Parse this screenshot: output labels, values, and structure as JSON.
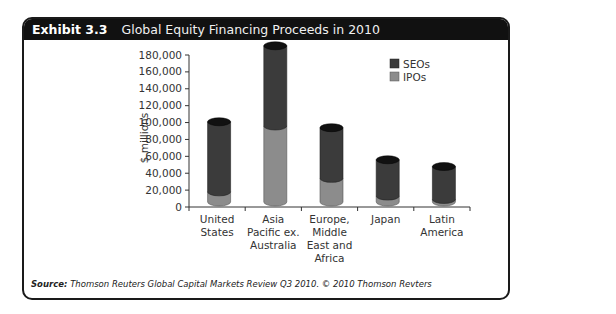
{
  "exhibit": {
    "number": "Exhibit 3.3",
    "title": "Global Equity Financing Proceeds in 2010"
  },
  "source": {
    "label": "Source:",
    "text": "Thomson Reuters Global Capital Markets Review Q3 2010. © 2010 Thomson Revters"
  },
  "colors": {
    "seo": "#3b3b3b",
    "seo_top": "#111111",
    "ipo": "#8c8c8c",
    "ipo_light": "#a5a5a5",
    "header_bg": "#111111"
  },
  "chart_data": {
    "type": "bar",
    "stacked": true,
    "style": "3d-cylinder",
    "title": "Global Equity Financing Proceeds in 2010",
    "xlabel": "",
    "ylabel": "$ millions",
    "ylim": [
      0,
      180000
    ],
    "yticks": [
      0,
      20000,
      40000,
      60000,
      80000,
      100000,
      120000,
      140000,
      160000,
      180000
    ],
    "ytick_labels": [
      "0",
      "20,000",
      "40,000",
      "60,000",
      "80,000",
      "100,000",
      "120,000",
      "140,000",
      "160,000",
      "180,000"
    ],
    "grid": false,
    "legend_position": "upper right",
    "categories": [
      [
        "United",
        "States"
      ],
      [
        "Asia",
        "Pacific ex.",
        "Australia"
      ],
      [
        "Europe,",
        "Middle",
        "East and",
        "Africa"
      ],
      [
        "Japan"
      ],
      [
        "Latin",
        "America"
      ]
    ],
    "category_names": [
      "United States",
      "Asia Pacific ex. Australia",
      "Europe, Middle East and Africa",
      "Japan",
      "Latin America"
    ],
    "series": [
      {
        "name": "IPOs",
        "values": [
          12000,
          90000,
          28000,
          7000,
          3000
        ]
      },
      {
        "name": "SEOs",
        "values": [
          83000,
          95000,
          60000,
          43000,
          39000
        ]
      }
    ],
    "legend": [
      "SEOs",
      "IPOs"
    ]
  }
}
